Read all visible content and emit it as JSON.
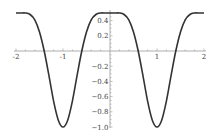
{
  "chart_data": {
    "type": "line",
    "title": "",
    "xlabel": "",
    "ylabel": "",
    "xlim": [
      -2,
      2
    ],
    "ylim": [
      -1.0,
      0.5
    ],
    "grid": false,
    "legend": "none",
    "x_ticks": [
      {
        "value": -2,
        "label": "-2"
      },
      {
        "value": -1,
        "label": "-1"
      },
      {
        "value": 1,
        "label": "1"
      },
      {
        "value": 2,
        "label": "2"
      }
    ],
    "y_ticks": [
      {
        "value": 0.4,
        "label": "0.4"
      },
      {
        "value": 0.2,
        "label": "0.2"
      },
      {
        "value": -0.2,
        "label": "−0.2"
      },
      {
        "value": -0.4,
        "label": "−0.4"
      },
      {
        "value": -0.6,
        "label": "−0.6"
      },
      {
        "value": -0.8,
        "label": "−0.8"
      },
      {
        "value": -1.0,
        "label": "−1.0"
      }
    ],
    "series": [
      {
        "name": "f(x)",
        "color": "#333333",
        "x": [
          -2.0,
          -1.9,
          -1.8,
          -1.7,
          -1.6,
          -1.5,
          -1.4,
          -1.3,
          -1.2,
          -1.1,
          -1.0,
          -0.9,
          -0.8,
          -0.7,
          -0.6,
          -0.5,
          -0.4,
          -0.3,
          -0.2,
          -0.1,
          0.0,
          0.1,
          0.2,
          0.3,
          0.4,
          0.5,
          0.6,
          0.7,
          0.8,
          0.9,
          1.0,
          1.1,
          1.2,
          1.3,
          1.4,
          1.5,
          1.6,
          1.7,
          1.8,
          1.9,
          2.0
        ],
        "y": [
          0.5,
          0.5,
          0.5,
          0.48,
          0.41,
          0.25,
          0.0,
          -0.32,
          -0.66,
          -0.91,
          -1.0,
          -0.91,
          -0.66,
          -0.32,
          0.0,
          0.25,
          0.41,
          0.48,
          0.5,
          0.5,
          0.5,
          0.5,
          0.5,
          0.48,
          0.41,
          0.25,
          0.0,
          -0.32,
          -0.66,
          -0.91,
          -1.0,
          -0.91,
          -0.66,
          -0.32,
          0.0,
          0.25,
          0.41,
          0.48,
          0.5,
          0.5,
          0.5
        ]
      }
    ]
  }
}
